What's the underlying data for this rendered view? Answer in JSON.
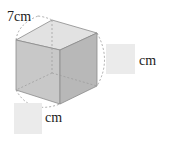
{
  "figure": {
    "shape": "cube",
    "given_edge": {
      "value": "7",
      "unit": "cm",
      "label": "7cm"
    },
    "right_edge": {
      "answer_box": "",
      "unit": "cm"
    },
    "bottom_edge": {
      "answer_box": "",
      "unit": "cm"
    },
    "colors": {
      "front_face": "#c8c8c8",
      "right_face": "#b8b8b8",
      "top_face": "#e2e2e2",
      "edge": "#8a8a8a",
      "answer_box": "#ebebeb"
    }
  }
}
